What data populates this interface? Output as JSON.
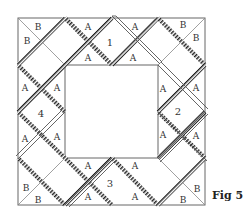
{
  "figure": {
    "caption": "Fig 5",
    "colors": {
      "outline": "#666666",
      "strip": "#555555",
      "strip_hatch": "#222222",
      "background": "#ffffff"
    }
  },
  "sections": {
    "top": "1",
    "right": "2",
    "bottom": "3",
    "left": "4"
  },
  "labels": {
    "A": "A",
    "B": "B"
  }
}
